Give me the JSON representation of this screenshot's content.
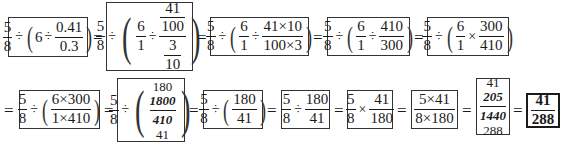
{
  "row1": {
    "step1": {
      "a_num": "5",
      "a_den": "8",
      "div": "÷",
      "whole": "6",
      "div2": "÷",
      "b_num": "0.41",
      "b_den": "0.3"
    },
    "step2": {
      "a_num": "5",
      "a_den": "8",
      "div": "÷",
      "c_num": "6",
      "c_den": "1",
      "div2": "÷",
      "top_num": "41",
      "top_den": "100",
      "bot_num": "3",
      "bot_den": "10"
    },
    "step3": {
      "a_num": "5",
      "a_den": "8",
      "div": "÷",
      "c_num": "6",
      "c_den": "1",
      "div2": "÷",
      "d_num": "41×10",
      "d_den": "100×3"
    },
    "step4": {
      "a_num": "5",
      "a_den": "8",
      "div": "÷",
      "c_num": "6",
      "c_den": "1",
      "div2": "÷",
      "d_num": "410",
      "d_den": "300"
    },
    "step5": {
      "a_num": "5",
      "a_den": "8",
      "div": "÷",
      "c_num": "6",
      "c_den": "1",
      "mul": "×",
      "d_num": "300",
      "d_den": "410"
    }
  },
  "row2": {
    "step6": {
      "a_num": "5",
      "a_den": "8",
      "div": "÷",
      "d_num": "6×300",
      "d_den": "1×410"
    },
    "step7": {
      "a_num": "5",
      "a_den": "8",
      "div": "÷",
      "num_reduced": "180",
      "num_cancelled": "1800",
      "den_cancelled": "410",
      "den_reduced": "41"
    },
    "step8": {
      "a_num": "5",
      "a_den": "8",
      "div": "÷",
      "d_num": "180",
      "d_den": "41"
    },
    "step9": {
      "a_num": "5",
      "a_den": "8",
      "div": "÷",
      "d_num": "180",
      "d_den": "41"
    },
    "step10": {
      "a_num": "5",
      "a_den": "8",
      "mul": "×",
      "d_num": "41",
      "d_den": "180"
    },
    "step11": {
      "num": "5×41",
      "den": "8×180"
    },
    "step12": {
      "num_reduced": "41",
      "num_cancelled": "205",
      "den_cancelled": "1440",
      "den_reduced": "288"
    },
    "result": {
      "num": "41",
      "den": "288"
    }
  },
  "equals": "="
}
